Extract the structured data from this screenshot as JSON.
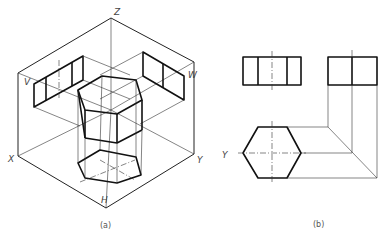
{
  "figure_a": {
    "caption": "(a)",
    "axis_labels": {
      "z": "Z",
      "v": "V",
      "w": "W",
      "x": "X",
      "y": "Y",
      "h": "H"
    }
  },
  "figure_b": {
    "caption": "(b)",
    "axis_label_y": "Y"
  },
  "colors": {
    "line": "#111111",
    "background": "#ffffff"
  }
}
